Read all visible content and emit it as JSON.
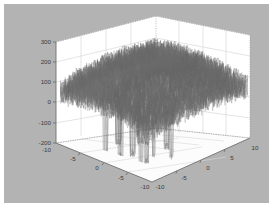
{
  "figure": {
    "background_color": "#b3b3b3",
    "wall_color": "#ffffff",
    "floor_color": "#fbfbfb",
    "grid_color": "#cfcfcf",
    "axis_color": "#7a7a7a",
    "mesh_color": "#6e6e6e",
    "border_color": "#ffffff"
  },
  "chart_data": {
    "type": "line",
    "render_style": "3d-mesh-surface",
    "title": "",
    "xlabel": "",
    "ylabel": "",
    "zlabel": "",
    "grid": true,
    "legend": null,
    "xlim": [
      -10,
      10
    ],
    "ylim": [
      -10,
      10
    ],
    "zlim": [
      -200,
      300
    ],
    "x_ticks": [
      -10,
      -5,
      0,
      5,
      10
    ],
    "x_tick_labels": [
      "-10",
      "-5",
      "0",
      "5",
      "10"
    ],
    "y_ticks": [
      -10,
      -5,
      0,
      5,
      10
    ],
    "y_tick_labels": [
      "-10",
      "-5",
      "0",
      "5",
      "10"
    ],
    "z_ticks": [
      -200,
      -100,
      0,
      100,
      200,
      300
    ],
    "z_tick_labels": [
      "-200",
      "-100",
      "0",
      "100",
      "200",
      "300"
    ],
    "series": [
      {
        "name": "mesh-surface",
        "baseline_center": 150,
        "baseline_edge": 50,
        "noise_amplitude": 60,
        "peak_max": 235,
        "spike_min": -205,
        "spike_count": 14,
        "grid_n": 120
      }
    ]
  },
  "z_axis": {
    "labels": [
      "300",
      "200",
      "100",
      "0",
      "-100",
      "-200"
    ],
    "corner_extra_label": "-10"
  },
  "x_axis_front_left": {
    "labels": [
      "-5",
      "0",
      "-5",
      "-10"
    ]
  },
  "y_axis_front_right": {
    "labels": [
      "-10",
      "-5",
      "0",
      "5",
      "10"
    ]
  }
}
